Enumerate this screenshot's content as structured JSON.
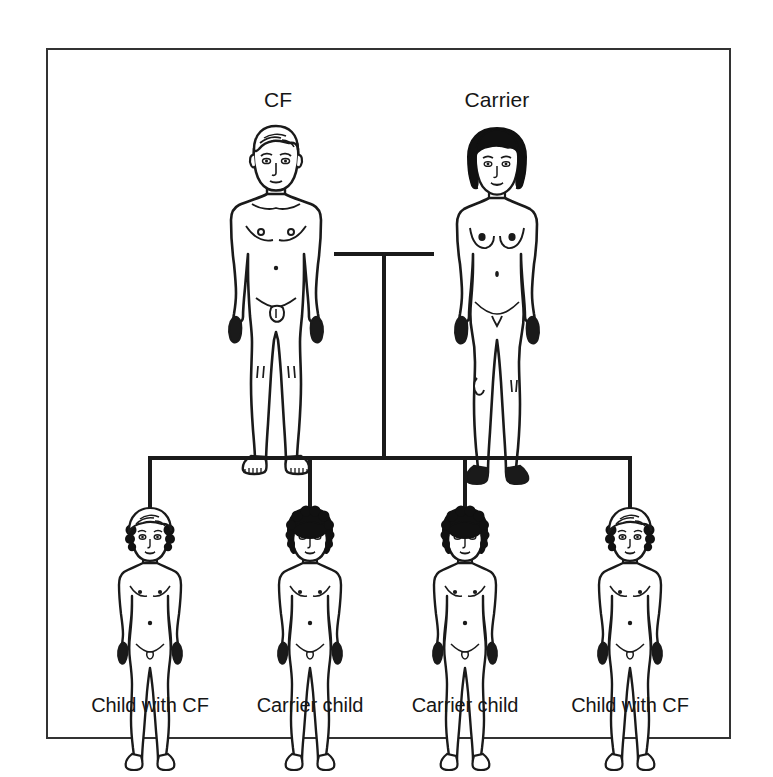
{
  "figure": {
    "border_color": "#333333",
    "background": "#ffffff",
    "line_color": "#1a1a1a",
    "hair_dark_color": "#111111",
    "hair_light_color": "#ffffff"
  },
  "parents": [
    {
      "id": "father",
      "label": "CF",
      "sex": "male",
      "status": "affected",
      "hair": "light",
      "label_x": 278,
      "label_y": 102,
      "center_x": 276
    },
    {
      "id": "mother",
      "label": "Carrier",
      "sex": "female",
      "status": "carrier",
      "hair": "dark",
      "label_x": 497,
      "label_y": 102,
      "center_x": 497
    }
  ],
  "children": [
    {
      "id": "child-1",
      "label": "Child with CF",
      "status": "affected",
      "hair": "light",
      "center_x": 150,
      "label_y": 708
    },
    {
      "id": "child-2",
      "label": "Carrier child",
      "status": "carrier",
      "hair": "dark",
      "center_x": 310,
      "label_y": 708
    },
    {
      "id": "child-3",
      "label": "Carrier child",
      "status": "carrier",
      "hair": "dark",
      "center_x": 465,
      "label_y": 708
    },
    {
      "id": "child-4",
      "label": "Child with CF",
      "status": "affected",
      "hair": "light",
      "center_x": 630,
      "label_y": 708
    }
  ],
  "connectors": {
    "marriage_line": {
      "x1": 334,
      "x2": 434,
      "y": 254
    },
    "descent_line": {
      "x": 384,
      "y1": 254,
      "y2": 458
    },
    "sibship_bar": {
      "x1": 150,
      "x2": 630,
      "y": 458
    },
    "child_drops_y2": 508,
    "stroke_width": 4
  },
  "border": {
    "x": 47,
    "y": 49,
    "width": 683,
    "height": 689,
    "stroke_width": 2
  }
}
